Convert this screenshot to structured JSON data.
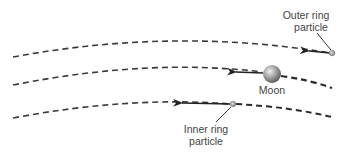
{
  "diagram": {
    "orbits": [
      {
        "name": "outer-orbit",
        "style": "dashed"
      },
      {
        "name": "moon-orbit",
        "style": "dashed"
      },
      {
        "name": "inner-orbit",
        "style": "dashed"
      }
    ],
    "labels": {
      "outer_line1": "Outer ring",
      "outer_line2": "particle",
      "moon": "Moon",
      "inner_line1": "Inner ring",
      "inner_line2": "particle"
    },
    "colors": {
      "orbit": "#3a3a3a",
      "arrow": "#222222",
      "moon_light": "#e8e8e8",
      "moon_dark": "#5a5a5a",
      "particle": "#9a9a9a",
      "text": "#444444"
    }
  }
}
